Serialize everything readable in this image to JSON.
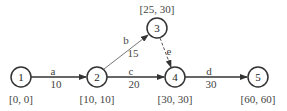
{
  "nodes": [
    {
      "id": "1",
      "label": "1",
      "times": "[0, 0]"
    },
    {
      "id": "2",
      "label": "2",
      "times": "[10, 10]"
    },
    {
      "id": "3",
      "label": "3",
      "times": "[25, 30]"
    },
    {
      "id": "4",
      "label": "4",
      "times": "[30, 30]"
    },
    {
      "id": "5",
      "label": "5",
      "times": "[60, 60]"
    }
  ],
  "edges": [
    {
      "from": "1",
      "to": "2",
      "name": "a",
      "weight": "10",
      "style": "solid"
    },
    {
      "from": "2",
      "to": "3",
      "name": "b",
      "weight": "15",
      "style": "solid"
    },
    {
      "from": "2",
      "to": "4",
      "name": "c",
      "weight": "20",
      "style": "solid"
    },
    {
      "from": "3",
      "to": "4",
      "name": "e",
      "weight": "",
      "style": "dashed"
    },
    {
      "from": "4",
      "to": "5",
      "name": "d",
      "weight": "30",
      "style": "solid"
    }
  ],
  "colors": {
    "stroke": "#333333",
    "text": "#444444",
    "background": "#ffffff"
  }
}
